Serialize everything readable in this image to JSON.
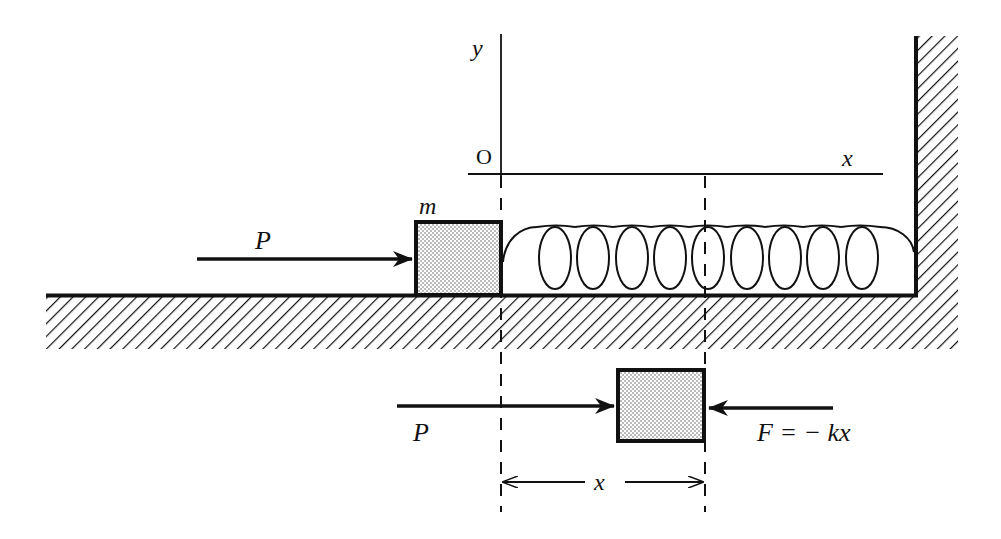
{
  "diagram": {
    "axes": {
      "origin_label": "O",
      "x_label": "x",
      "y_label": "y"
    },
    "mass": {
      "label": "m",
      "fill_pattern": "stipple"
    },
    "forces": {
      "applied_top": "P",
      "applied_bottom": "P",
      "spring_force": "F = − kx"
    },
    "displacement": {
      "label": "x"
    },
    "spring": {
      "loops": 9
    },
    "colors": {
      "ink": "#111111",
      "background": "#ffffff",
      "stipple": "#bdbdbd"
    }
  }
}
